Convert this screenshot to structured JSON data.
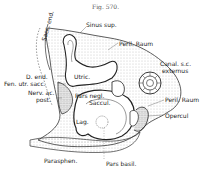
{
  "figure": {
    "title": "Fig. 570."
  },
  "labels": {
    "sinus_sup": "Sinus sup.",
    "peril_raum_top": "Peril. Raum",
    "canal_sc_ext_1": "Canal. s.c.",
    "canal_sc_ext_2": "externus",
    "peril_raum_right": "Peril. Raum",
    "opercul": "Opercul",
    "d_end": "D. end.",
    "fen_utr_sacc": "Fen. utr. sacc.",
    "nerv_ac_1": "Nerv. ac.",
    "nerv_ac_2": "post.",
    "utric": "Utric.",
    "pars_negl": "Pars negl.",
    "saccul": "Saccul.",
    "lag": "Lag.",
    "sacc_end": "Sacc. end.",
    "parasphen": "Parasphen.",
    "pars_basil": "Pars basil."
  },
  "colors": {
    "ink": "#222222",
    "background": "#ffffff",
    "stipple": "#888888"
  }
}
